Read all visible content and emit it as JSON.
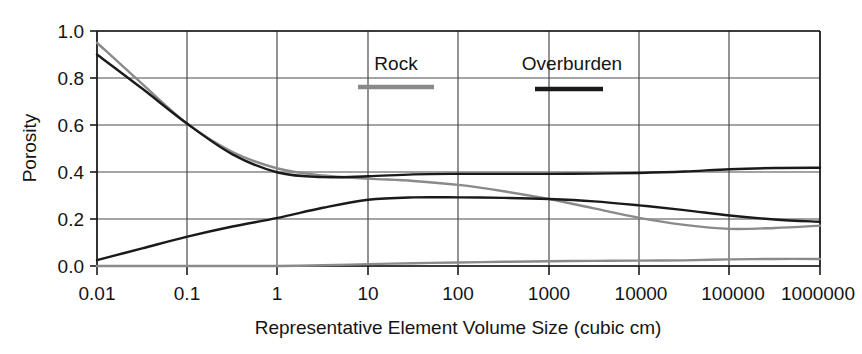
{
  "chart_data": {
    "type": "line",
    "title": "",
    "xlabel": "Representative Element Volume Size (cubic cm)",
    "ylabel": "Porosity",
    "xscale": "log",
    "xlim": [
      0.01,
      1000000
    ],
    "ylim": [
      0.0,
      1.0
    ],
    "grid": true,
    "xticks": [
      0.01,
      0.1,
      1,
      10,
      100,
      1000,
      10000,
      100000,
      1000000
    ],
    "xtick_labels": [
      "0.01",
      "0.1",
      "1",
      "10",
      "100",
      "1000",
      "10000",
      "100000",
      "1000000"
    ],
    "yticks": [
      0.0,
      0.2,
      0.4,
      0.6,
      0.8,
      1.0
    ],
    "ytick_labels": [
      "0.0",
      "0.2",
      "0.4",
      "0.6",
      "0.8",
      "1.0"
    ],
    "legend_position": "upper-center-inside",
    "legend": [
      {
        "name": "Rock",
        "color": "#8a8a8a"
      },
      {
        "name": "Overburden",
        "color": "#1a1a1a"
      }
    ],
    "series": [
      {
        "name": "rock-upper",
        "legend_group": "Rock",
        "color": "#8a8a8a",
        "x": [
          0.01,
          0.0316,
          0.1,
          0.316,
          1,
          3.16,
          10,
          31.6,
          100,
          316,
          1000,
          3160,
          10000,
          31600,
          100000,
          316000,
          1000000
        ],
        "y": [
          0.95,
          0.775,
          0.605,
          0.485,
          0.415,
          0.385,
          0.372,
          0.362,
          0.345,
          0.318,
          0.285,
          0.245,
          0.205,
          0.175,
          0.158,
          0.162,
          0.172
        ]
      },
      {
        "name": "overburden-upper",
        "legend_group": "Overburden",
        "color": "#1a1a1a",
        "x": [
          0.01,
          0.0316,
          0.1,
          0.316,
          1,
          3.16,
          10,
          31.6,
          100,
          316,
          1000,
          3160,
          10000,
          31600,
          100000,
          316000,
          1000000
        ],
        "y": [
          0.9,
          0.755,
          0.605,
          0.475,
          0.398,
          0.378,
          0.382,
          0.39,
          0.392,
          0.392,
          0.392,
          0.393,
          0.396,
          0.402,
          0.412,
          0.417,
          0.418
        ]
      },
      {
        "name": "overburden-lower",
        "legend_group": "Overburden",
        "color": "#1a1a1a",
        "x": [
          0.01,
          0.0316,
          0.1,
          0.316,
          1,
          3.16,
          10,
          31.6,
          100,
          316,
          1000,
          3160,
          10000,
          31600,
          100000,
          316000,
          1000000
        ],
        "y": [
          0.025,
          0.075,
          0.125,
          0.168,
          0.205,
          0.248,
          0.282,
          0.292,
          0.292,
          0.29,
          0.285,
          0.275,
          0.258,
          0.238,
          0.215,
          0.198,
          0.188
        ]
      },
      {
        "name": "rock-lower",
        "legend_group": "Rock",
        "color": "#8a8a8a",
        "x": [
          0.01,
          0.0316,
          0.1,
          0.316,
          1,
          3.16,
          10,
          31.6,
          100,
          316,
          1000,
          3160,
          10000,
          31600,
          100000,
          316000,
          1000000
        ],
        "y": [
          0.0,
          0.0,
          0.0,
          0.0,
          0.0,
          0.003,
          0.008,
          0.012,
          0.015,
          0.018,
          0.02,
          0.022,
          0.023,
          0.024,
          0.028,
          0.03,
          0.03
        ]
      }
    ]
  },
  "axes": {
    "ylabel": "Porosity",
    "xlabel": "Representative Element Volume Size (cubic cm)"
  },
  "legend": {
    "rock_label": "Rock",
    "overburden_label": "Overburden"
  },
  "ytick_labels": {
    "t0": "1.0",
    "t1": "0.8",
    "t2": "0.6",
    "t3": "0.4",
    "t4": "0.2",
    "t5": "0.0"
  },
  "xtick_labels": {
    "t0": "0.01",
    "t1": "0.1",
    "t2": "1",
    "t3": "10",
    "t4": "100",
    "t5": "1000",
    "t6": "10000",
    "t7": "100000",
    "t8": "1000000"
  },
  "colors": {
    "rock": "#8a8a8a",
    "overburden": "#1a1a1a",
    "grid": "#4a4a4a",
    "axis": "#1a1a1a",
    "background": "#ffffff"
  }
}
